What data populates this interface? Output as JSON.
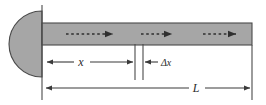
{
  "figure": {
    "type": "physics-diagram",
    "background_color": "#ffffff",
    "stroke_color": "#3a3a3a",
    "tube": {
      "name": "tube",
      "fill_color": "#a6a6a6",
      "border_color": "#4a4a4a",
      "x_start": 42,
      "x_end": 252,
      "y_top": 23,
      "y_bottom": 45
    },
    "piston": {
      "name": "piston-cone",
      "fill_color": "#a6a6a6",
      "border_color": "#4a4a4a",
      "shape": "half-ellipse",
      "center_x": 42,
      "center_y": 44,
      "rx": 33,
      "ry": 33
    },
    "wall_line": {
      "name": "left-reference-line",
      "x": 42,
      "y_top": 5,
      "y_bottom": 100
    },
    "right_line": {
      "name": "right-reference-line",
      "x": 252,
      "y_top": 45,
      "y_bottom": 100
    },
    "flow_arrows": [
      {
        "name": "flow-arrow-1",
        "x_start": 66,
        "x_end": 113,
        "y": 34,
        "style": "dashed"
      },
      {
        "name": "flow-arrow-2",
        "x_start": 141,
        "x_end": 172,
        "y": 34,
        "style": "dashed"
      },
      {
        "name": "flow-arrow-3",
        "x_start": 203,
        "x_end": 236,
        "y": 34,
        "style": "dashed"
      }
    ],
    "segment_ticks": [
      {
        "name": "segment-tick-left",
        "x": 135,
        "y_top": 44,
        "y_bottom": 80
      },
      {
        "name": "segment-tick-right",
        "x": 143,
        "y_top": 44,
        "y_bottom": 80
      }
    ],
    "dimensions": [
      {
        "name": "dimension-x",
        "label": "x",
        "label_x": 81,
        "label_y": 64,
        "line_y": 62,
        "x_start": 46,
        "x_end": 134,
        "gap_start": 74,
        "gap_end": 90,
        "arrows": "both"
      },
      {
        "name": "dimension-delta-x",
        "label": "Δx",
        "label_x": 158,
        "label_y": 64,
        "line_y": 62,
        "x_start": 144,
        "x_end": 156,
        "arrows": "left"
      },
      {
        "name": "dimension-L",
        "label": "L",
        "label_x": 196,
        "label_y": 90,
        "line_y": 88,
        "x_start": 45,
        "x_end": 251,
        "gap_start": 189,
        "gap_end": 205,
        "arrows": "both"
      }
    ]
  }
}
